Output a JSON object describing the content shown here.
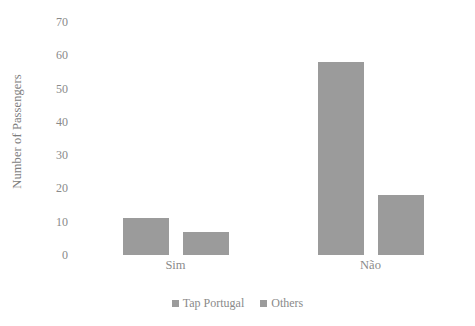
{
  "chart_data": {
    "type": "bar",
    "title": "",
    "subtitle": "",
    "xlabel": "",
    "ylabel": "Number of Passengers",
    "categories": [
      "Sim",
      "Não"
    ],
    "series": [
      {
        "name": "Tap Portugal",
        "values": [
          11,
          58
        ],
        "color": "#9b9b9b"
      },
      {
        "name": "Others",
        "values": [
          7,
          18
        ],
        "color": "#9b9b9b"
      }
    ],
    "ylim": [
      0,
      70
    ],
    "ytick_step": 10,
    "yticks": [
      0,
      10,
      20,
      30,
      40,
      50,
      60,
      70
    ],
    "ytick_labels": [
      "0",
      "10",
      "20",
      "30",
      "40",
      "50",
      "60",
      "70"
    ],
    "grid": false,
    "legend_position": "bottom",
    "background_color": "#ffffff",
    "text_color": "#8a8a8a"
  }
}
